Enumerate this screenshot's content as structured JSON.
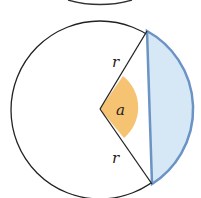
{
  "diagram": {
    "labels": {
      "radius_top": "r",
      "radius_bottom": "r",
      "angle": "a"
    },
    "colors": {
      "segment_fill": "#d6e8f5",
      "segment_stroke": "#6b93c4",
      "angle_fill": "#f5b85a",
      "line": "#222222"
    }
  }
}
